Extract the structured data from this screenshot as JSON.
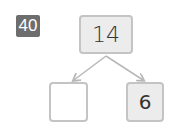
{
  "problem": {
    "number": "40"
  },
  "number_bond": {
    "whole": "14",
    "parts": [
      "",
      "6"
    ]
  },
  "colors": {
    "badge": "#6d6d6d",
    "box_border": "#c4c4c4",
    "box_fill": "#ececec",
    "arrow": "#b8b8b8"
  }
}
